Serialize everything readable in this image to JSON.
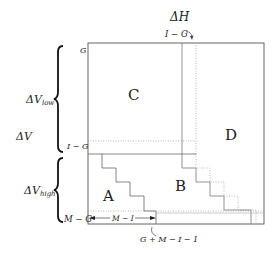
{
  "diagram": {
    "type": "matrix-region-diagram",
    "regions": {
      "A": "A",
      "B": "B",
      "C": "C",
      "D": "D"
    },
    "top_labels": {
      "delta_h": "ΔH",
      "i_minus_g": "I − G"
    },
    "left_axis_labels": {
      "g": "G",
      "i_minus_g": "I − G",
      "m_minus_g": "M − G"
    },
    "brace_labels": {
      "delta_v_low_main": "ΔV",
      "delta_v_low_sub": "low",
      "delta_v": "ΔV",
      "delta_v_high_main": "ΔV",
      "delta_v_high_sub": "high"
    },
    "bottom_labels": {
      "m_minus_i": "M − I",
      "g_plus_m_minus_i_minus_1": "G + M − I − 1"
    },
    "colors": {
      "line": "#555555",
      "dotted": "#888888",
      "text": "#222222"
    }
  }
}
